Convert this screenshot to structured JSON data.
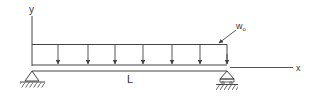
{
  "diagram": {
    "type": "simply-supported-beam-uniform-load",
    "labels": {
      "y_axis": "y",
      "x_axis": "x",
      "length": "L",
      "load": "w",
      "load_subscript": "o"
    },
    "colors": {
      "line": "#444444",
      "background": "#ffffff"
    },
    "load_arrows_x": [
      58,
      88,
      115,
      143,
      172,
      200,
      227
    ],
    "supports": [
      {
        "type": "pin",
        "x": 32
      },
      {
        "type": "roller",
        "x": 227
      }
    ]
  }
}
